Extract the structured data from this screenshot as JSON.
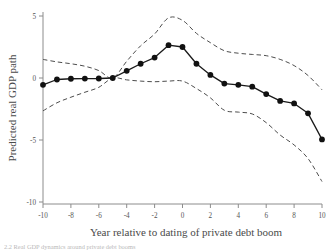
{
  "figure": {
    "caption_partial": "2.2 Real GDP dynamics around private debt booms"
  },
  "axes": {
    "ylabel": "Predicted real GDP path",
    "xlabel": "Year relative to dating of  private debt boom",
    "y_ticks": [
      "5",
      "0",
      "-5",
      "-10"
    ],
    "x_ticks": [
      "-10",
      "-8",
      "-6",
      "-4",
      "-2",
      "0",
      "2",
      "4",
      "6",
      "8",
      "10"
    ]
  },
  "colors": {
    "line": "#1a1a1a",
    "marker": "#111111",
    "band": "#4d4d4d",
    "axis": "#8c8c8c",
    "text": "#4a4a4a",
    "background": "#ffffff"
  },
  "chart_data": {
    "type": "line",
    "title": "",
    "xlabel": "Year relative to dating of  private debt boom",
    "ylabel": "Predicted real GDP path",
    "xlim": [
      -10,
      10
    ],
    "ylim": [
      -10,
      5
    ],
    "x_ticks": [
      -10,
      -8,
      -6,
      -4,
      -2,
      0,
      2,
      4,
      6,
      8,
      10
    ],
    "y_ticks": [
      5,
      0,
      -5,
      -10
    ],
    "grid": false,
    "legend": null,
    "x": [
      -10,
      -9,
      -8,
      -7,
      -6,
      -5,
      -4,
      -3,
      -2,
      -1,
      0,
      1,
      2,
      3,
      4,
      5,
      6,
      7,
      8,
      9,
      10
    ],
    "series": [
      {
        "name": "Predicted real GDP path",
        "style": "solid-with-markers",
        "values": [
          -0.55,
          -0.12,
          -0.06,
          -0.05,
          -0.04,
          0.0,
          0.58,
          1.15,
          1.65,
          2.65,
          2.5,
          1.15,
          0.25,
          -0.45,
          -0.55,
          -0.7,
          -1.3,
          -1.85,
          -2.05,
          -2.85,
          -4.95
        ]
      },
      {
        "name": "Upper confidence band",
        "style": "dashed",
        "values": [
          1.5,
          1.3,
          1.15,
          0.95,
          0.6,
          0.0,
          1.35,
          2.6,
          3.55,
          4.85,
          4.65,
          3.6,
          2.85,
          2.2,
          2.0,
          1.9,
          1.8,
          1.5,
          1.0,
          0.2,
          -0.95
        ]
      },
      {
        "name": "Lower confidence band",
        "style": "dashed",
        "values": [
          -2.65,
          -2.0,
          -1.55,
          -1.15,
          -0.75,
          0.0,
          -0.15,
          -0.25,
          -0.3,
          -0.25,
          -0.25,
          -0.85,
          -1.6,
          -2.6,
          -2.75,
          -2.9,
          -3.6,
          -4.6,
          -5.4,
          -6.5,
          -8.35
        ]
      }
    ]
  }
}
